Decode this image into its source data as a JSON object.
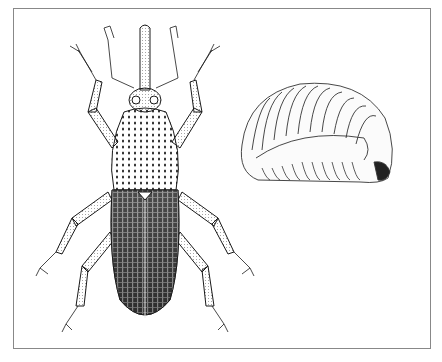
{
  "figure": {
    "subjects": [
      {
        "name": "adult weevil",
        "view": "dorsal"
      },
      {
        "name": "larva",
        "view": "lateral, curled"
      }
    ],
    "colors": {
      "ink": "#1a1a1a",
      "paper": "#ffffff",
      "frame": "#888888"
    }
  }
}
